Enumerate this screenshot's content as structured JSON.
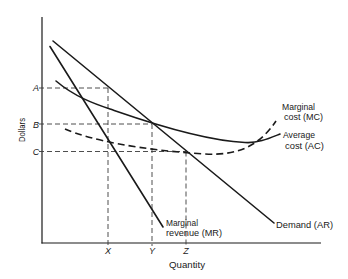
{
  "figure": {
    "y_axis": {
      "label": "Dollars",
      "price_levels": [
        {
          "id": "A",
          "label": "A"
        },
        {
          "id": "B",
          "label": "B"
        },
        {
          "id": "C",
          "label": "C"
        }
      ]
    },
    "x_axis": {
      "label": "Quantity",
      "quantity_levels": [
        {
          "id": "X",
          "label": "X"
        },
        {
          "id": "Y",
          "label": "Y"
        },
        {
          "id": "Z",
          "label": "Z"
        }
      ]
    },
    "curves": {
      "marginal_cost": {
        "label_line1": "Marginal",
        "label_line2": "cost (MC)",
        "style": "dashed"
      },
      "average_cost": {
        "label_line1": "Average",
        "label_line2": "cost (AC)",
        "style": "solid"
      },
      "demand": {
        "label": "Demand (AR)",
        "style": "solid"
      },
      "marginal_revenue": {
        "label_line1": "Marginal",
        "label_line2": "revenue (MR)",
        "style": "solid"
      }
    },
    "guides": [
      {
        "from": "A",
        "to": "X",
        "meets": "Demand (AR)"
      },
      {
        "from": "B",
        "to": "Y",
        "meets": "Demand (AR) / Average cost (AC)"
      },
      {
        "from": "C",
        "to": "Z",
        "meets": "Demand (AR) / Marginal cost (MC)"
      }
    ],
    "colors": {
      "line": "#1a1a1a",
      "guide": "#3a3a3a",
      "background": "#ffffff"
    }
  }
}
